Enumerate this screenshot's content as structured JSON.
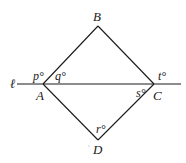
{
  "diagram": {
    "type": "geometry",
    "line_label": "ℓ",
    "vertices": {
      "A": {
        "label": "A",
        "x": 43,
        "y": 84
      },
      "B": {
        "label": "B",
        "x": 98,
        "y": 26
      },
      "C": {
        "label": "C",
        "x": 154,
        "y": 84
      },
      "D": {
        "label": "D",
        "x": 98,
        "y": 140
      }
    },
    "angles": {
      "p": "p°",
      "q": "q°",
      "r": "r°",
      "s": "s°",
      "t": "t°"
    },
    "colors": {
      "stroke": "#1a1a1a",
      "background": "#ffffff"
    }
  }
}
